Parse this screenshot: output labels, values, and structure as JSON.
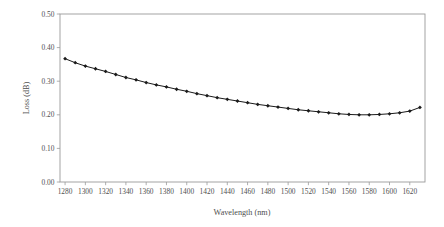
{
  "chart_data": {
    "type": "line",
    "title": "",
    "xlabel": "Wavelength (nm)",
    "ylabel": "Loss (dB)",
    "xlim": [
      1275,
      1635
    ],
    "ylim": [
      0.0,
      0.5
    ],
    "grid": false,
    "legend": null,
    "xticks": [
      1280,
      1300,
      1320,
      1340,
      1360,
      1380,
      1400,
      1420,
      1440,
      1460,
      1480,
      1500,
      1520,
      1540,
      1560,
      1580,
      1600,
      1620
    ],
    "xtick_labels": [
      "1280",
      "1300",
      "1320",
      "1340",
      "1360",
      "1380",
      "1400",
      "1420",
      "1440",
      "1460",
      "1480",
      "1500",
      "1520",
      "1540",
      "1560",
      "1580",
      "1600",
      "1620"
    ],
    "yticks": [
      0.0,
      0.1,
      0.2,
      0.3,
      0.4,
      0.5
    ],
    "ytick_labels": [
      "0.00",
      "0.10",
      "0.20",
      "0.30",
      "0.40",
      "0.50"
    ],
    "marker": "diamond",
    "line_color": "#1a1a1a",
    "series": [
      {
        "name": "Loss",
        "x": [
          1280,
          1290,
          1300,
          1310,
          1320,
          1330,
          1340,
          1350,
          1360,
          1370,
          1380,
          1390,
          1400,
          1410,
          1420,
          1430,
          1440,
          1450,
          1460,
          1470,
          1480,
          1490,
          1500,
          1510,
          1520,
          1530,
          1540,
          1550,
          1560,
          1570,
          1580,
          1590,
          1600,
          1610,
          1620,
          1630
        ],
        "values": [
          0.367,
          0.355,
          0.345,
          0.337,
          0.329,
          0.32,
          0.311,
          0.304,
          0.296,
          0.289,
          0.283,
          0.276,
          0.27,
          0.263,
          0.257,
          0.251,
          0.246,
          0.241,
          0.236,
          0.231,
          0.227,
          0.223,
          0.219,
          0.215,
          0.212,
          0.209,
          0.206,
          0.203,
          0.201,
          0.2,
          0.2,
          0.201,
          0.203,
          0.206,
          0.211,
          0.222
        ]
      }
    ]
  },
  "axis": {
    "x_title": "Wavelength (nm)",
    "y_title": "Loss (dB)"
  }
}
